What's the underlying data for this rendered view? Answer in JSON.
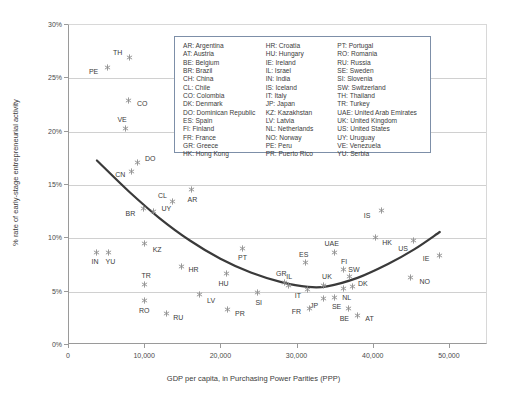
{
  "chart_data": {
    "type": "scatter",
    "title": "",
    "xlabel": "GDP per capita, in Purchasing Power Parities (PPP)",
    "ylabel": "% rate of early-stage entrepreneurial activity",
    "xlim": [
      0,
      55000
    ],
    "ylim": [
      0,
      30
    ],
    "xticks": [
      0,
      10000,
      20000,
      30000,
      40000,
      50000
    ],
    "xtick_labels": [
      "0",
      "10,000",
      "20,000",
      "30,000",
      "40,000",
      "50,000"
    ],
    "yticks": [
      0,
      5,
      10,
      15,
      20,
      25,
      30
    ],
    "ytick_labels": [
      "0%",
      "5%",
      "10%",
      "15%",
      "20%",
      "25%",
      "30%"
    ],
    "grid": "horizontal",
    "legend_position": "inside-top-center",
    "points": [
      {
        "code": "TH",
        "x": 8100,
        "y": 26.9,
        "lx": -12,
        "ly": -5
      },
      {
        "code": "PE",
        "x": 5200,
        "y": 25.9,
        "lx": -14,
        "ly": 3
      },
      {
        "code": "CO",
        "x": 7900,
        "y": 22.8,
        "lx": 14,
        "ly": 2
      },
      {
        "code": "VE",
        "x": 7500,
        "y": 20.2,
        "lx": -3,
        "ly": -10
      },
      {
        "code": "DO",
        "x": 9100,
        "y": 17.0,
        "lx": 13,
        "ly": -5
      },
      {
        "code": "CN",
        "x": 8300,
        "y": 16.2,
        "lx": -11,
        "ly": 3
      },
      {
        "code": "AR",
        "x": 16200,
        "y": 14.5,
        "lx": 1,
        "ly": 10
      },
      {
        "code": "CL",
        "x": 13700,
        "y": 13.4,
        "lx": -10,
        "ly": -6
      },
      {
        "code": "UY",
        "x": 11200,
        "y": 12.4,
        "lx": 13,
        "ly": -4
      },
      {
        "code": "BR",
        "x": 9900,
        "y": 12.7,
        "lx": -13,
        "ly": 4
      },
      {
        "code": "IS",
        "x": 41100,
        "y": 12.5,
        "lx": -14,
        "ly": 4
      },
      {
        "code": "HK",
        "x": 40300,
        "y": 10.0,
        "lx": 12,
        "ly": 5
      },
      {
        "code": "US",
        "x": 45300,
        "y": 9.7,
        "lx": -10,
        "ly": 7
      },
      {
        "code": "KZ",
        "x": 10000,
        "y": 9.4,
        "lx": 13,
        "ly": 5
      },
      {
        "code": "PT",
        "x": 22900,
        "y": 9.0,
        "lx": 0,
        "ly": 9
      },
      {
        "code": "UAE",
        "x": 35000,
        "y": 8.6,
        "lx": -3,
        "ly": -9
      },
      {
        "code": "IN",
        "x": 3800,
        "y": 8.6,
        "lx": -2,
        "ly": 9
      },
      {
        "code": "YU",
        "x": 5300,
        "y": 8.6,
        "lx": 2,
        "ly": 9
      },
      {
        "code": "IE",
        "x": 48700,
        "y": 8.3,
        "lx": -13,
        "ly": 3
      },
      {
        "code": "ES",
        "x": 31200,
        "y": 7.6,
        "lx": -2,
        "ly": -9
      },
      {
        "code": "FI",
        "x": 36100,
        "y": 7.0,
        "lx": 1,
        "ly": -8
      },
      {
        "code": "HR",
        "x": 14900,
        "y": 7.3,
        "lx": 12,
        "ly": 3
      },
      {
        "code": "HU",
        "x": 20800,
        "y": 6.6,
        "lx": -3,
        "ly": 9
      },
      {
        "code": "SW",
        "x": 37000,
        "y": 6.3,
        "lx": 4,
        "ly": -8
      },
      {
        "code": "GR",
        "x": 28400,
        "y": 5.8,
        "lx": -3,
        "ly": -9
      },
      {
        "code": "NO",
        "x": 45000,
        "y": 6.2,
        "lx": 14,
        "ly": 3
      },
      {
        "code": "TR",
        "x": 10000,
        "y": 5.6,
        "lx": 2,
        "ly": -9
      },
      {
        "code": "IL",
        "x": 28900,
        "y": 5.5,
        "lx": 1,
        "ly": -9
      },
      {
        "code": "UK",
        "x": 33600,
        "y": 5.5,
        "lx": 3,
        "ly": -9
      },
      {
        "code": "DK",
        "x": 37400,
        "y": 5.4,
        "lx": 10,
        "ly": -3
      },
      {
        "code": "NL",
        "x": 36200,
        "y": 5.2,
        "lx": 3,
        "ly": 8
      },
      {
        "code": "IT",
        "x": 31500,
        "y": 5.1,
        "lx": -10,
        "ly": 5
      },
      {
        "code": "SI",
        "x": 24900,
        "y": 4.8,
        "lx": 1,
        "ly": 9
      },
      {
        "code": "LV",
        "x": 17200,
        "y": 4.6,
        "lx": 12,
        "ly": 5
      },
      {
        "code": "SE",
        "x": 35000,
        "y": 4.4,
        "lx": 2,
        "ly": 9
      },
      {
        "code": "JP",
        "x": 33500,
        "y": 4.3,
        "lx": -9,
        "ly": 7
      },
      {
        "code": "FR",
        "x": 31700,
        "y": 3.3,
        "lx": -13,
        "ly": 2
      },
      {
        "code": "RO",
        "x": 10000,
        "y": 4.1,
        "lx": 0,
        "ly": 10
      },
      {
        "code": "BE",
        "x": 36800,
        "y": 3.3,
        "lx": -4,
        "ly": 9
      },
      {
        "code": "AT",
        "x": 38000,
        "y": 2.7,
        "lx": 12,
        "ly": 3
      },
      {
        "code": "PR",
        "x": 21000,
        "y": 3.2,
        "lx": 12,
        "ly": 3
      },
      {
        "code": "RU",
        "x": 12900,
        "y": 2.9,
        "lx": 12,
        "ly": 4
      }
    ],
    "trend_curve": {
      "description": "U-shaped quadratic fit",
      "points": [
        {
          "x": 3800,
          "y": 17.2
        },
        {
          "x": 8000,
          "y": 14.3
        },
        {
          "x": 12000,
          "y": 11.8
        },
        {
          "x": 16000,
          "y": 9.7
        },
        {
          "x": 20000,
          "y": 8.0
        },
        {
          "x": 24000,
          "y": 6.7
        },
        {
          "x": 28000,
          "y": 5.8
        },
        {
          "x": 31500,
          "y": 5.35
        },
        {
          "x": 34000,
          "y": 5.4
        },
        {
          "x": 38000,
          "y": 6.2
        },
        {
          "x": 42000,
          "y": 7.5
        },
        {
          "x": 45500,
          "y": 8.9
        },
        {
          "x": 48800,
          "y": 10.5
        }
      ],
      "color": "#3a3a3a"
    }
  },
  "legend": {
    "columns": [
      [
        "AR: Argentina",
        "AT: Austria",
        "BE: Belgium",
        "BR: Brazil",
        "CH: China",
        "CL: Chile",
        "CO: Colombia",
        "DK: Denmark",
        "DO: Dominican Republic",
        "ES: Spain",
        "FI: Finland",
        "FR: France",
        "GR: Greece",
        "HK: Hong Kong"
      ],
      [
        "HR: Croatia",
        "HU: Hungary",
        "IE: Ireland",
        "IL: Israel",
        "IN: India",
        "IS: Iceland",
        "IT: Italy",
        "JP: Japan",
        "KZ: Kazakhstan",
        "LV: Latvia",
        "NL: Netherlands",
        "NO: Norway",
        "PE: Peru",
        "PR: Puerto Rico"
      ],
      [
        "PT: Portugal",
        "RO: Romania",
        "RU: Russia",
        "SE: Sweden",
        "SI: Slovenia",
        "SW: Switzerland",
        "TH: Thailand",
        "TR: Turkey",
        "UAE: United Arab Emirates",
        "UK: United Kingdom",
        "US: United States",
        "UY: Uruguay",
        "VE: Venezuela",
        "YU: Serbia"
      ]
    ],
    "border_color": "#7d8fa8"
  },
  "style": {
    "marker_color": "#8d8d8d",
    "grid_color": "#d0d0d0",
    "axis_color": "#9a9a9a",
    "text_color": "#3b3b3b",
    "background": "#ffffff"
  }
}
